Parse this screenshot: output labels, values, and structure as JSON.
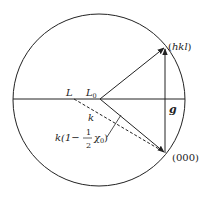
{
  "diagram": {
    "type": "ewald-sphere-construction",
    "circle": {
      "cx": 99,
      "cy": 100,
      "r": 86
    },
    "points": {
      "L": {
        "label": "L",
        "x": 74,
        "y": 99
      },
      "L0": {
        "label": "L",
        "sub": "0",
        "x": 100,
        "y": 99
      },
      "hkl": {
        "label": "(hkl)",
        "x": 165,
        "y": 47
      },
      "origin": {
        "label": "(000)",
        "x": 165,
        "y": 153
      }
    },
    "labels": {
      "L": "L",
      "L0_main": "L",
      "L0_sub": "0",
      "hkl_open": "(",
      "hkl_text": "hkl",
      "hkl_close": ")",
      "origin": "(000)",
      "g": "g",
      "k": "k",
      "k_expr_prefix": "k(1−",
      "k_expr_num": "1",
      "k_expr_den": "2",
      "k_expr_chi": "χ",
      "k_expr_chi_sub": "0",
      "k_expr_close": ")"
    },
    "colors": {
      "stroke": "#222222",
      "background": "#ffffff"
    }
  }
}
